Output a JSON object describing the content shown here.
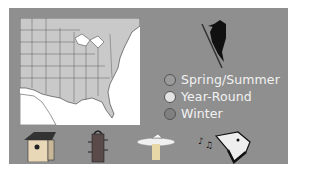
{
  "panel": {
    "background": "#8f8f8f"
  },
  "map": {
    "region": "Eastern United States range map",
    "range_color": "#c9c9c9"
  },
  "bird": {
    "icon": "woodpecker-icon"
  },
  "legend": {
    "items": [
      {
        "label": "Spring/Summer",
        "color": "#9a9a9a"
      },
      {
        "label": "Year-Round",
        "color": "#e3e3e3"
      },
      {
        "label": "Winter",
        "color": "#808080"
      }
    ]
  },
  "bottom_icons": [
    {
      "name": "birdhouse-icon"
    },
    {
      "name": "feeder-icon"
    },
    {
      "name": "birdbath-icon"
    },
    {
      "name": "bird-song-icon"
    }
  ]
}
